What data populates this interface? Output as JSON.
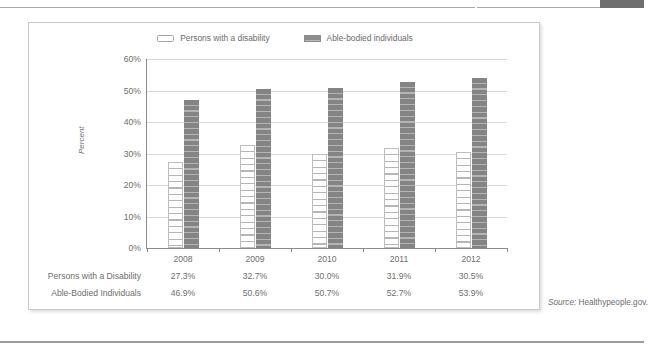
{
  "chart_data": {
    "type": "bar",
    "title": "",
    "xlabel": "",
    "ylabel": "Percent",
    "ylim": [
      0,
      60
    ],
    "y_ticks": [
      "0%",
      "10%",
      "20%",
      "30%",
      "40%",
      "50%",
      "60%"
    ],
    "grid": true,
    "legend_position": "top-center",
    "categories": [
      "2008",
      "2009",
      "2010",
      "2011",
      "2012"
    ],
    "series": [
      {
        "name": "Persons with a disability",
        "table_label": "Persons with a Disability",
        "values": [
          27.3,
          32.7,
          30.0,
          31.9,
          30.5
        ],
        "labels": [
          "27.3%",
          "32.7%",
          "30.0%",
          "31.9%",
          "30.5%"
        ],
        "color": "#ffffff",
        "pattern": "horizontal-stripes-outlined"
      },
      {
        "name": "Able-bodied individuals",
        "table_label": "Able-Bodied Individuals",
        "values": [
          46.9,
          50.6,
          50.7,
          52.7,
          53.9
        ],
        "labels": [
          "46.9%",
          "50.6%",
          "50.7%",
          "52.7%",
          "53.9%"
        ],
        "color": "#8d8d8d",
        "pattern": "horizontal-stripes-gray"
      }
    ]
  },
  "legend": {
    "entries": [
      {
        "label": "Persons with a disability",
        "swatch": "legend-swatch-white"
      },
      {
        "label": "Able-bodied individuals",
        "swatch": "legend-swatch-gray"
      }
    ]
  },
  "axis": {
    "y_title": "Percent",
    "y_ticks": [
      "60%",
      "50%",
      "40%",
      "30%",
      "20%",
      "10%",
      "0%"
    ]
  },
  "table": {
    "year_header": [
      "2008",
      "2009",
      "2010",
      "2011",
      "2012"
    ],
    "rows": [
      {
        "label": "Persons with a Disability",
        "cells": [
          "27.3%",
          "32.7%",
          "30.0%",
          "31.9%",
          "30.5%"
        ]
      },
      {
        "label": "Able-Bodied Individuals",
        "cells": [
          "46.9%",
          "50.6%",
          "50.7%",
          "52.7%",
          "53.9%"
        ]
      }
    ]
  },
  "source": {
    "key": "Source:",
    "value": "Healthypeople.gov."
  }
}
